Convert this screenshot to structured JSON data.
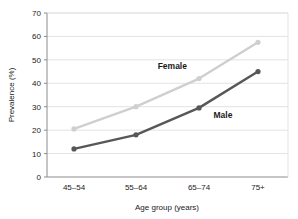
{
  "chart_data": {
    "type": "line",
    "title": "",
    "xlabel": "Age group (years)",
    "ylabel": "Prevalence (%)",
    "categories": [
      "45–54",
      "55–64",
      "65–74",
      "75+"
    ],
    "ylim": [
      0,
      70
    ],
    "ytick_labels": [
      "0",
      "10",
      "20",
      "30",
      "40",
      "50",
      "60",
      "70"
    ],
    "yticks": [
      0,
      10,
      20,
      30,
      40,
      50,
      60,
      70
    ],
    "grid": true,
    "legend_position": "inline-annotation",
    "series": [
      {
        "name": "Female",
        "values": [
          20.5,
          30,
          42,
          57.5
        ],
        "color": "#cfcfcf",
        "label": "Female"
      },
      {
        "name": "Male",
        "values": [
          12,
          18,
          29.5,
          45
        ],
        "color": "#575757",
        "label": "Male"
      }
    ],
    "annotations": [
      {
        "text": "Female",
        "x_frac": 0.52,
        "value": 46
      },
      {
        "text": "Male",
        "x_frac": 0.73,
        "value": 25
      }
    ]
  },
  "colors": {
    "background": "#ffffff",
    "axis": "#8c8c8c",
    "grid": "#e3e3e3",
    "text": "#1a1a1a",
    "female": "#cfcfcf",
    "male": "#575757"
  }
}
